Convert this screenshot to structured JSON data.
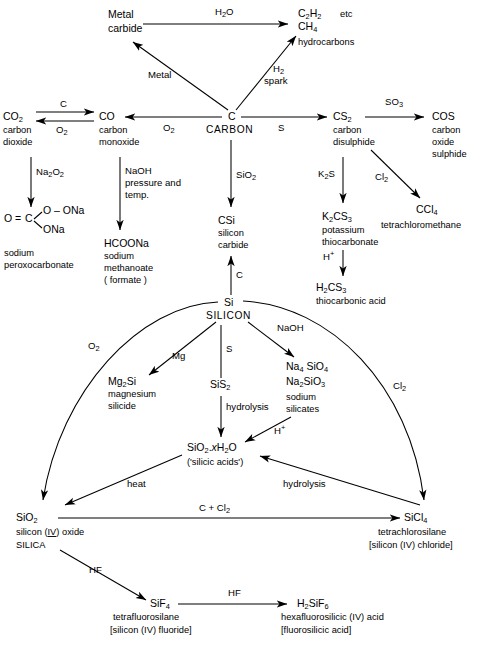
{
  "nodes": {
    "metal_carbide": {
      "line1": "Metal",
      "line2": "carbide"
    },
    "hydrocarbons": {
      "f1_a": "C",
      "f1_b": "2",
      "f1_c": "H",
      "f1_d": "2",
      "etc": "etc",
      "f2_a": "CH",
      "f2_b": "4",
      "name": "hydrocarbons"
    },
    "carbon_dioxide": {
      "formula_a": "CO",
      "formula_b": "2",
      "name1": "carbon",
      "name2": "dioxide"
    },
    "carbon_monoxide": {
      "formula": "CO",
      "name1": "carbon",
      "name2": "monoxide"
    },
    "carbon": {
      "formula": "C",
      "name": "CARBON"
    },
    "carbon_disulphide": {
      "formula_a": "CS",
      "formula_b": "2",
      "name1": "carbon",
      "name2": "disulphide"
    },
    "carbon_oxide_sulphide": {
      "formula": "COS",
      "name1": "carbon",
      "name2": "oxide",
      "name3": "sulphide"
    },
    "sodium_peroxocarbonate": {
      "core_o": "O",
      "core_eq": "=",
      "core_c": "C",
      "branch_top": "O – ONa",
      "branch_bottom": "ONa",
      "name1": "sodium",
      "name2": "peroxocarbonate"
    },
    "sodium_methanoate": {
      "formula": "HCOONa",
      "name1": "sodium",
      "name2": "methanoate",
      "name3": "( formate )"
    },
    "silicon_carbide": {
      "formula": "CSi",
      "name1": "silicon",
      "name2": "carbide"
    },
    "potassium_thiocarbonate": {
      "f_a": "K",
      "f_b": "2",
      "f_c": "CS",
      "f_d": "3",
      "name1": "potassium",
      "name2": "thiocarbonate"
    },
    "thiocarbonic_acid": {
      "f_a": "H",
      "f_b": "2",
      "f_c": "CS",
      "f_d": "3",
      "name": "thiocarbonic acid"
    },
    "tetrachloromethane": {
      "f_a": "CCl",
      "f_b": "4",
      "name": "tetrachloromethane"
    },
    "silicon": {
      "formula": "Si",
      "name": "SILICON"
    },
    "magnesium_silicide": {
      "f_a": "Mg",
      "f_b": "2",
      "f_c": "Si",
      "name1": "magnesium",
      "name2": "silicide"
    },
    "silicon_disulphide": {
      "f_a": "SiS",
      "f_b": "2"
    },
    "sodium_silicates": {
      "f1_a": "Na",
      "f1_b": "4",
      "f1_c": " SiO",
      "f1_d": "4",
      "f2_a": "Na",
      "f2_b": "2",
      "f2_c": "SiO",
      "f2_d": "3",
      "name1": "sodium",
      "name2": "silicates"
    },
    "silicic_acids": {
      "f_a": "SiO",
      "f_b": "2",
      "f_dot": ".",
      "f_x": "x",
      "f_c": "H",
      "f_d": "2",
      "f_e": "O",
      "name": "('silicic acids')"
    },
    "silica": {
      "f_a": "SiO",
      "f_b": "2",
      "name1_pre": "silicon  (",
      "name1_rn": "IV",
      "name1_post": ") oxide",
      "name2": "SILICA"
    },
    "tetrachlorosilane": {
      "f_a": "SiCl",
      "f_b": "4",
      "name1": "tetrachlorosilane",
      "name2": "[silicon (IV)  chloride]"
    },
    "tetrafluorosilane": {
      "f_a": "SiF",
      "f_b": "4",
      "name1": "tetrafluorosilane",
      "name2": "[silicon (IV) fluoride]"
    },
    "hexafluorosilicic_acid": {
      "f_a": "H",
      "f_b": "2",
      "f_c": "SiF",
      "f_d": "6",
      "name1": "hexafluorosilicic  (IV) acid",
      "name2": "[fluorosilicic  acid]"
    }
  },
  "reagents": {
    "h2o": {
      "a": "H",
      "b": "2",
      "c": "O"
    },
    "metal": "Metal",
    "h2_spark": {
      "a": "H",
      "b": "2",
      "line2": "spark"
    },
    "c_label": "C",
    "o2_back": {
      "a": "O",
      "b": "2"
    },
    "o2_to_co": {
      "a": "O",
      "b": "2"
    },
    "s_to_cs2": "S",
    "so3": {
      "a": "SO",
      "b": "3"
    },
    "na2o2": {
      "a": "Na",
      "b": "2",
      "c": "O",
      "d": "2"
    },
    "naoh_pressure": {
      "line1": "NaOH",
      "line2": "pressure and",
      "line3": "temp."
    },
    "sio2_down": {
      "a": "SiO",
      "b": "2"
    },
    "k2s": {
      "a": "K",
      "b": "2",
      "c": "S"
    },
    "cl2_ccl4": {
      "a": "Cl",
      "b": "2"
    },
    "h_plus": {
      "a": "H",
      "b": "+"
    },
    "c_up_to_csi": "C",
    "o2_curve": {
      "a": "O",
      "b": "2"
    },
    "mg": "Mg",
    "s_to_sis2": "S",
    "naoh_silicates": "NaOH",
    "cl2_curve": {
      "a": "Cl",
      "b": "2"
    },
    "hydrolysis_sis2": "hydrolysis",
    "h_plus_silicates": {
      "a": "H",
      "b": "+"
    },
    "heat": "heat",
    "hydrolysis_sicl4": "hydrolysis",
    "c_plus_cl2": {
      "a": "C + Cl",
      "b": "2"
    },
    "hf_1": "HF",
    "hf_2": "HF"
  },
  "colors": {
    "ink": "#000000",
    "paper": "#ffffff"
  }
}
